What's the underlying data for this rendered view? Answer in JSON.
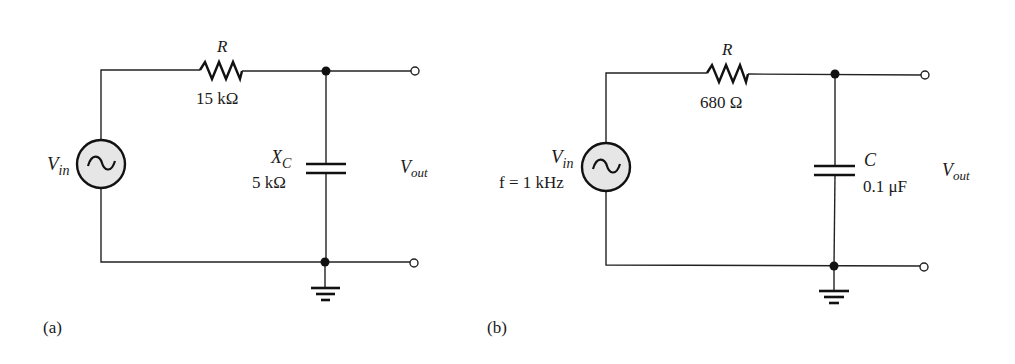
{
  "figure": {
    "circuits": [
      {
        "id": "a",
        "panel_label": "(a)",
        "source": {
          "label_main": "V",
          "label_sub": "in",
          "extra": ""
        },
        "resistor": {
          "name": "R",
          "value": "15 kΩ"
        },
        "capacitor": {
          "name_main": "X",
          "name_sub": "C",
          "value": "5 kΩ"
        },
        "output": {
          "label_main": "V",
          "label_sub": "out"
        }
      },
      {
        "id": "b",
        "panel_label": "(b)",
        "source": {
          "label_main": "V",
          "label_sub": "in",
          "extra": "f = 1 kHz"
        },
        "resistor": {
          "name": "R",
          "value": "680 Ω"
        },
        "capacitor": {
          "name_main": "C",
          "name_sub": "",
          "value": "0.1 μF"
        },
        "output": {
          "label_main": "V",
          "label_sub": "out"
        }
      }
    ]
  }
}
